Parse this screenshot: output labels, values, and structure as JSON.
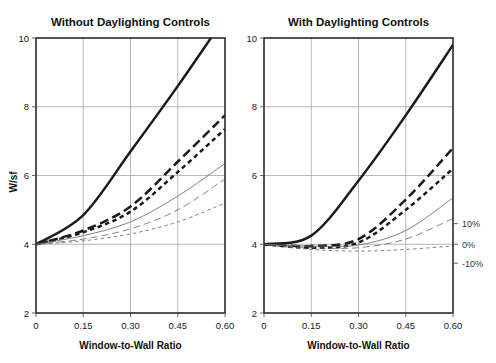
{
  "figure": {
    "y_axis_label": "W/sf",
    "x_axis_label": "Window-to-Wall Ratio"
  },
  "panels": [
    {
      "title": "Without Daylighting Controls"
    },
    {
      "title": "With Daylighting Controls"
    }
  ],
  "legend": {
    "items": [
      {
        "label": "10%"
      },
      {
        "label": "0%"
      },
      {
        "label": "-10%"
      }
    ]
  },
  "chart_data": [
    {
      "type": "line",
      "title": "Without Daylighting Controls",
      "xlabel": "Window-to-Wall Ratio",
      "ylabel": "W/sf",
      "xlim": [
        0,
        0.6
      ],
      "ylim": [
        2,
        10
      ],
      "xticks": [
        0,
        0.15,
        0.3,
        0.45,
        0.6
      ],
      "xticklabels": [
        "0",
        "0.15",
        "0.30",
        "0.45",
        "0.60"
      ],
      "yticks": [
        2,
        4,
        6,
        8,
        10
      ],
      "yticklabels": [
        "2",
        "4",
        "6",
        "8",
        "10"
      ],
      "grid": true,
      "legend_position": "none",
      "x": [
        0,
        0.15,
        0.3,
        0.45,
        0.6
      ],
      "series": [
        {
          "name": "bold-solid",
          "style": "solid",
          "weight": "heavy",
          "values": [
            4.0,
            4.85,
            6.7,
            8.6,
            10.6
          ]
        },
        {
          "name": "bold-long-dash",
          "style": "long-dash",
          "weight": "heavy",
          "values": [
            4.0,
            4.4,
            5.1,
            6.4,
            7.75
          ]
        },
        {
          "name": "bold-short-dash",
          "style": "short-dash",
          "weight": "heavy",
          "values": [
            4.0,
            4.35,
            4.95,
            6.1,
            7.35
          ]
        },
        {
          "name": "thin-solid",
          "style": "solid",
          "weight": "light",
          "values": [
            4.0,
            4.25,
            4.65,
            5.4,
            6.35
          ]
        },
        {
          "name": "thin-long-dash",
          "style": "long-dash",
          "weight": "light",
          "values": [
            4.0,
            4.15,
            4.45,
            5.0,
            5.9
          ]
        },
        {
          "name": "thin-short-dash",
          "style": "short-dash",
          "weight": "light",
          "values": [
            4.0,
            4.1,
            4.3,
            4.65,
            5.2
          ]
        }
      ]
    },
    {
      "type": "line",
      "title": "With Daylighting Controls",
      "xlabel": "Window-to-Wall Ratio",
      "ylabel": "W/sf",
      "xlim": [
        0,
        0.6
      ],
      "ylim": [
        2,
        10
      ],
      "xticks": [
        0,
        0.15,
        0.3,
        0.45,
        0.6
      ],
      "xticklabels": [
        "0",
        "0.15",
        "0.30",
        "0.45",
        "0.60"
      ],
      "yticks": [
        2,
        4,
        6,
        8,
        10
      ],
      "yticklabels": [
        "2",
        "4",
        "6",
        "8",
        "10"
      ],
      "grid": true,
      "legend_position": "right",
      "legend_entries": [
        "10%",
        "0%",
        "-10%"
      ],
      "x": [
        0,
        0.15,
        0.3,
        0.45,
        0.6
      ],
      "series": [
        {
          "name": "bold-solid",
          "style": "solid",
          "weight": "heavy",
          "values": [
            4.0,
            4.25,
            5.85,
            7.75,
            9.8
          ]
        },
        {
          "name": "bold-long-dash",
          "style": "long-dash",
          "weight": "heavy",
          "values": [
            4.0,
            3.95,
            4.15,
            5.3,
            6.8
          ]
        },
        {
          "name": "bold-short-dash",
          "style": "short-dash",
          "weight": "heavy",
          "values": [
            4.0,
            3.9,
            4.05,
            5.0,
            6.2
          ]
        },
        {
          "name": "thin-solid",
          "style": "solid",
          "weight": "light",
          "values": [
            4.0,
            3.95,
            3.98,
            4.4,
            5.35
          ]
        },
        {
          "name": "thin-long-dash",
          "style": "long-dash",
          "weight": "light",
          "values": [
            4.0,
            3.9,
            3.9,
            4.15,
            4.75
          ]
        },
        {
          "name": "thin-short-dash",
          "style": "short-dash",
          "weight": "light",
          "values": [
            4.0,
            3.85,
            3.8,
            3.85,
            3.95
          ]
        }
      ]
    }
  ],
  "colors": {
    "heavy_stroke": "#1a1a1a",
    "light_stroke": "#6e6e6e",
    "grid": "#9a9a9a",
    "frame": "#2b2b2b"
  }
}
